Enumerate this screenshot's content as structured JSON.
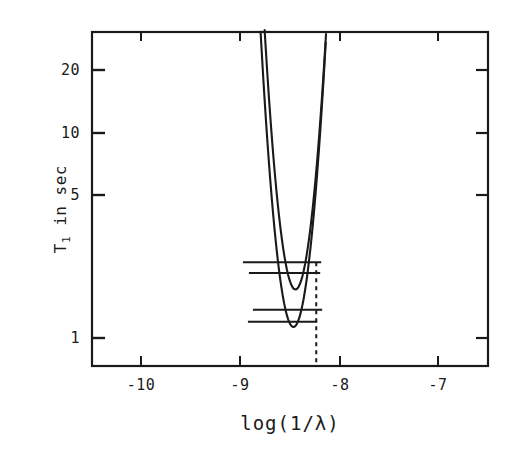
{
  "chart_data": {
    "type": "line",
    "title": "",
    "xlabel": "log(1/λ)",
    "ylabel_parts": {
      "symbol": "T",
      "subscript": "1",
      "rest": " in sec"
    },
    "ylabel": "T₁ in sec",
    "xscale": "linear",
    "yscale": "log",
    "xlim": [
      -10.5,
      -6.5
    ],
    "ylim": [
      0.78,
      27.0
    ],
    "grid": false,
    "legend": "none",
    "xticks": [
      -10,
      -9,
      -8,
      -7
    ],
    "xtick_labels": [
      "-10",
      "-9",
      "-8",
      "-7"
    ],
    "yticks": [
      1,
      5,
      10,
      20
    ],
    "ytick_labels": [
      "1",
      "5",
      "10",
      "20"
    ],
    "series": [
      {
        "name": "upper-curve",
        "style": "solid",
        "x_min": -8.44,
        "y_min": 1.72,
        "curvature": 13.0,
        "x_start": -10.11,
        "x_end": -6.68
      },
      {
        "name": "lower-curve",
        "style": "solid",
        "x_min": -8.46,
        "y_min": 1.13,
        "curvature": 13.0,
        "x_start": -10.22,
        "x_end": -6.58
      }
    ],
    "horizontal_bars": [
      {
        "name": "bar-upper-outer",
        "y": 2.33,
        "x_left": -8.97,
        "x_right": -8.18
      },
      {
        "name": "bar-upper-inner",
        "y": 2.07,
        "x_left": -8.91,
        "x_right": -8.19
      },
      {
        "name": "bar-lower-outer",
        "y": 1.37,
        "x_left": -8.87,
        "x_right": -8.17
      },
      {
        "name": "bar-lower-inner",
        "y": 1.2,
        "x_left": -8.92,
        "x_right": -8.22
      }
    ],
    "annotations": [
      {
        "name": "vertical-dashed-marker",
        "style": "dashed",
        "x": -8.23,
        "y_top": 2.33,
        "y_bottom": 0.78
      }
    ]
  },
  "axes": {
    "y_title": "T₁ in sec",
    "x_title": "log(1/λ)"
  }
}
